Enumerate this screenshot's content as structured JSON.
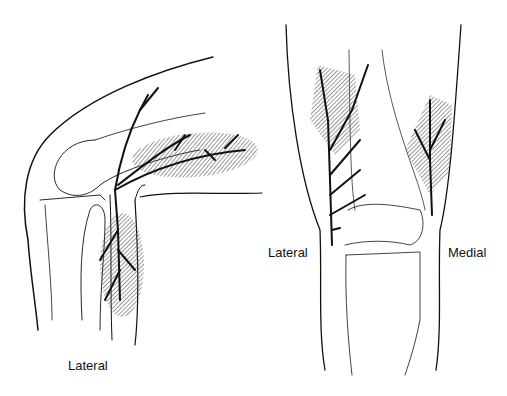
{
  "figure": {
    "panels": [
      {
        "view": "side (flexed knee)",
        "label": "Lateral"
      },
      {
        "view": "front",
        "labels": {
          "left": "Lateral",
          "right": "Medial"
        }
      }
    ]
  },
  "colors": {
    "line": "#111111",
    "hatch": "#555555",
    "background": "#ffffff"
  }
}
